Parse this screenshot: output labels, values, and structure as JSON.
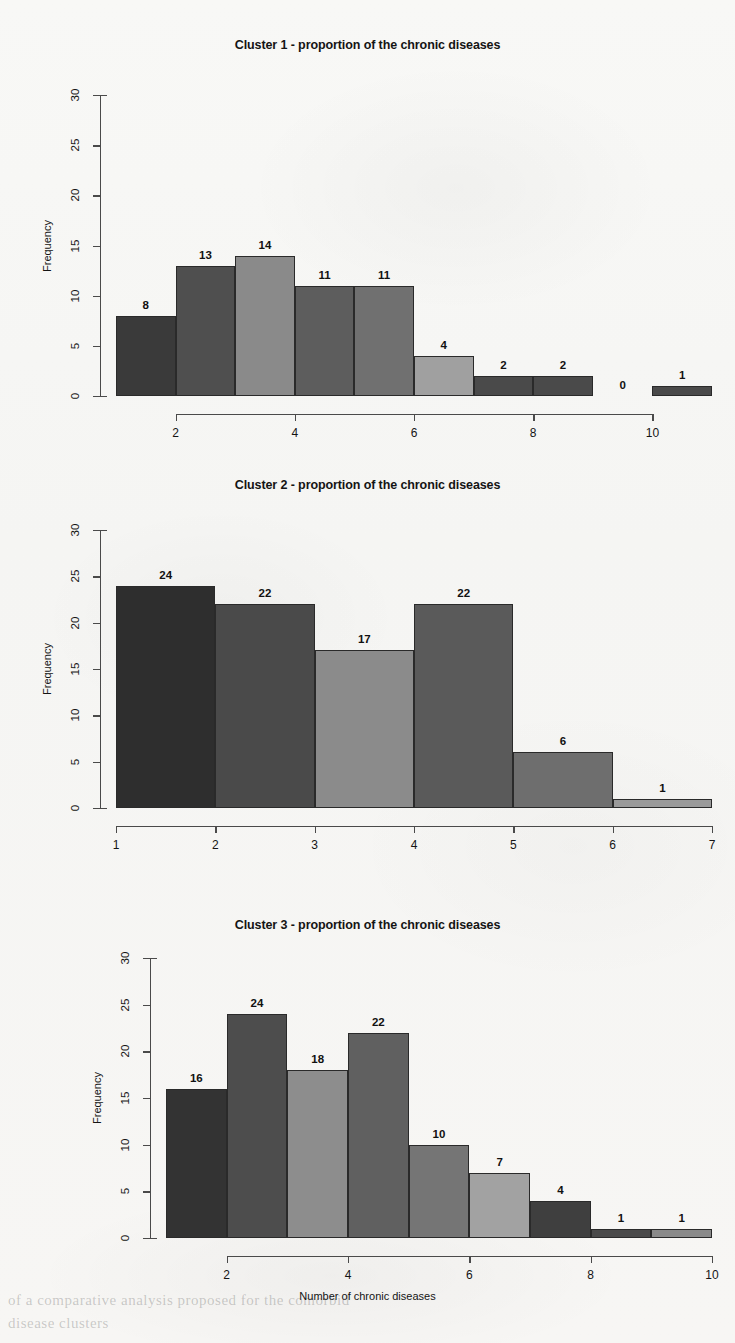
{
  "figure": {
    "xlabel": "Number of chronic diseases",
    "ylabel": "Frequency",
    "background_color": "#f7f7f5"
  },
  "ghost_text": {
    "line1": "of a comparative analysis proposed for the comorbid",
    "line2": "disease clusters"
  },
  "chart_data": [
    {
      "type": "bar",
      "title": "Cluster 1 - proportion of the chronic diseases",
      "xlabel": "",
      "ylabel": "Frequency",
      "categories": [
        "1",
        "2",
        "3",
        "4",
        "5",
        "6",
        "7",
        "8",
        "9",
        "10"
      ],
      "bin_edges": [
        1,
        2,
        3,
        4,
        5,
        6,
        7,
        8,
        9,
        10,
        11
      ],
      "values": [
        8,
        13,
        14,
        11,
        11,
        4,
        2,
        2,
        0,
        1
      ],
      "data_labels": [
        "8",
        "13",
        "14",
        "11",
        "11",
        "4",
        "2",
        "2",
        "0",
        "1"
      ],
      "ylim": [
        0,
        30
      ],
      "yticks": [
        0,
        5,
        10,
        15,
        20,
        25,
        30
      ],
      "ytick_labels": [
        "0",
        "5",
        "10",
        "15",
        "20",
        "25",
        "30"
      ],
      "xlim": [
        1,
        11
      ],
      "xticks": [
        2,
        4,
        6,
        8,
        10
      ],
      "xtick_labels": [
        "2",
        "4",
        "6",
        "8",
        "10"
      ],
      "bar_colors": [
        "#3a3a3a",
        "#4f4f4f",
        "#8a8a8a",
        "#5d5d5d",
        "#707070",
        "#a0a0a0",
        "#4a4a4a",
        "#4a4a4a",
        "#ffffff",
        "#4a4a4a"
      ],
      "grid": false,
      "legend": "none"
    },
    {
      "type": "bar",
      "title": "Cluster 2 - proportion of the chronic diseases",
      "xlabel": "",
      "ylabel": "Frequency",
      "categories": [
        "1",
        "2",
        "3",
        "4",
        "5",
        "6"
      ],
      "bin_edges": [
        1,
        2,
        3,
        4,
        5,
        6,
        7
      ],
      "values": [
        24,
        22,
        17,
        22,
        6,
        1
      ],
      "data_labels": [
        "24",
        "22",
        "17",
        "22",
        "6",
        "1"
      ],
      "ylim": [
        0,
        30
      ],
      "yticks": [
        0,
        5,
        10,
        15,
        20,
        25,
        30
      ],
      "ytick_labels": [
        "0",
        "5",
        "10",
        "15",
        "20",
        "25",
        "30"
      ],
      "xlim": [
        1,
        7
      ],
      "xticks": [
        1,
        2,
        3,
        4,
        5,
        6,
        7
      ],
      "xtick_labels": [
        "1",
        "2",
        "3",
        "4",
        "5",
        "6",
        "7"
      ],
      "bar_colors": [
        "#2e2e2e",
        "#4a4a4a",
        "#8b8b8b",
        "#5a5a5a",
        "#6e6e6e",
        "#9a9a9a"
      ],
      "grid": false,
      "legend": "none"
    },
    {
      "type": "bar",
      "title": "Cluster 3 - proportion of the chronic diseases",
      "xlabel": "Number of chronic diseases",
      "ylabel": "Frequency",
      "categories": [
        "1",
        "2",
        "3",
        "4",
        "5",
        "6",
        "7",
        "8",
        "9"
      ],
      "bin_edges": [
        1,
        2,
        3,
        4,
        5,
        6,
        7,
        8,
        9,
        10
      ],
      "values": [
        16,
        24,
        18,
        22,
        10,
        7,
        4,
        1,
        1
      ],
      "data_labels": [
        "16",
        "24",
        "18",
        "22",
        "10",
        "7",
        "4",
        "1",
        "1"
      ],
      "ylim": [
        0,
        30
      ],
      "yticks": [
        0,
        5,
        10,
        15,
        20,
        25,
        30
      ],
      "ytick_labels": [
        "0",
        "5",
        "10",
        "15",
        "20",
        "25",
        "30"
      ],
      "xlim": [
        1,
        10
      ],
      "xticks": [
        2,
        4,
        6,
        8,
        10
      ],
      "xtick_labels": [
        "2",
        "4",
        "6",
        "8",
        "10"
      ],
      "bar_colors": [
        "#333333",
        "#4d4d4d",
        "#8d8d8d",
        "#606060",
        "#757575",
        "#a2a2a2",
        "#3f3f3f",
        "#4a4a4a",
        "#8a8a8a"
      ],
      "grid": false,
      "legend": "none"
    }
  ]
}
